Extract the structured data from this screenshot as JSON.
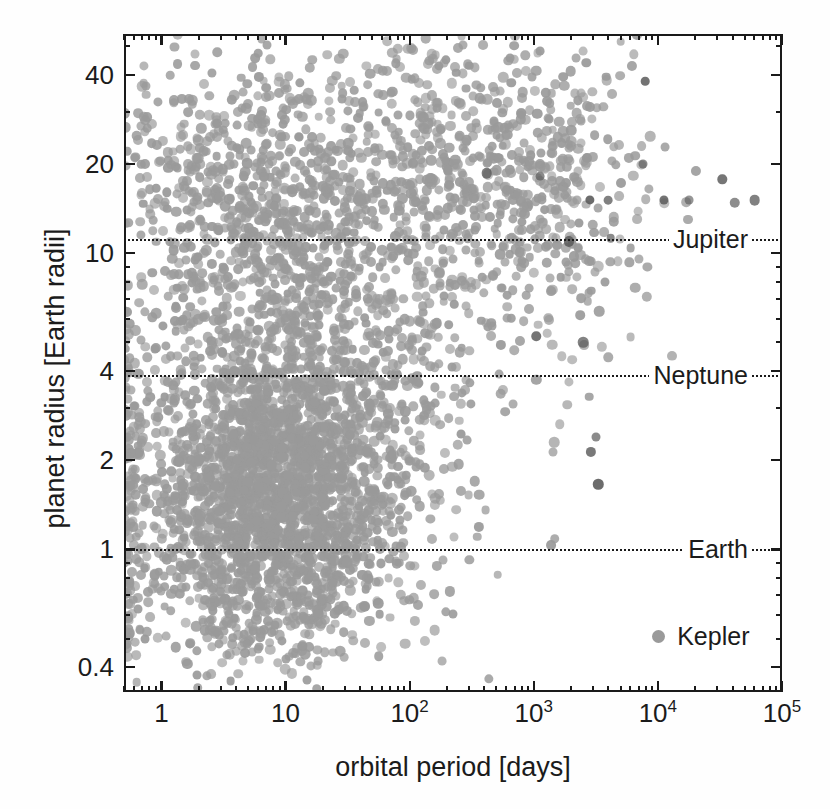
{
  "chart_data": {
    "type": "scatter",
    "title": "",
    "xlabel": "orbital period [days]",
    "ylabel": "planet radius [Earth radii]",
    "xscale": "log",
    "yscale": "log",
    "xlim": [
      0.5,
      100000
    ],
    "ylim": [
      0.33,
      55
    ],
    "grid": false,
    "xtick_labels": [
      "1",
      "10",
      "10²",
      "10³",
      "10⁴",
      "10⁵"
    ],
    "xtick_values": [
      1,
      10,
      100,
      1000,
      10000,
      100000
    ],
    "ytick_labels": [
      "0.4",
      "1",
      "2",
      "4",
      "10",
      "20",
      "40"
    ],
    "ytick_values": [
      0.4,
      1,
      2,
      4,
      10,
      20,
      40
    ],
    "series": [
      {
        "name": "Kepler",
        "marker": "circle",
        "color": "#9a9a9a",
        "n_points_approx": 3000,
        "description": "Kepler confirmed planets, orbital period vs planet radius"
      }
    ],
    "reference_lines": [
      {
        "label": "Jupiter",
        "value": 11.2,
        "units": "Earth radii",
        "style": "dotted"
      },
      {
        "label": "Neptune",
        "value": 3.88,
        "units": "Earth radii",
        "style": "dotted"
      },
      {
        "label": "Earth",
        "value": 1.0,
        "units": "Earth radii",
        "style": "dotted"
      }
    ],
    "legend": {
      "position": "bottom-right",
      "entries": [
        "Kepler"
      ]
    }
  },
  "axes": {
    "x_title": "orbital period [days]",
    "y_title": "planet radius [Earth radii]"
  },
  "legend": {
    "kepler_label": "Kepler",
    "kepler_color": "#9a9a9a"
  },
  "reference": {
    "jupiter_label": "Jupiter",
    "neptune_label": "Neptune",
    "earth_label": "Earth"
  },
  "colors": {
    "axis": "#1a1a1a",
    "marker": "#9a9a9a",
    "marker_dark": "#5a5a5a",
    "background": "#ffffff"
  }
}
